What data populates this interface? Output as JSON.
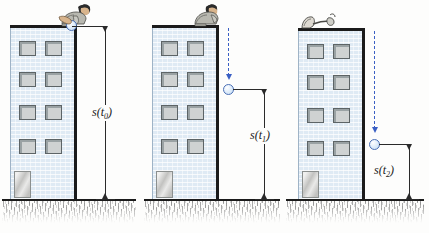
{
  "figure": {
    "background_color": "#fdfdfc",
    "building_color": "#dfeaf4",
    "ball_color": "#c3dcf2",
    "trajectory_color": "#3a5fc4",
    "outline_color": "#1b1b1b",
    "window_color": "#cfd2d2"
  },
  "panels": [
    {
      "id": "panel-1",
      "label": "s(t",
      "label_sub": "0",
      "label_close": ")",
      "label_full": "s(t0)",
      "person_pose": "leaning-over-roof-holding-ball",
      "ball_state": "held-at-roof-level",
      "trajectory_visible": false,
      "ball_height_description": "full building height",
      "windows_per_row": 2,
      "window_rows": 4
    },
    {
      "id": "panel-2",
      "label": "s(t",
      "label_sub": "1",
      "label_close": ")",
      "label_full": "s(t1)",
      "person_pose": "kneeling-watching-from-roof",
      "ball_state": "falling",
      "trajectory_visible": true,
      "ball_height_description": "partway down",
      "windows_per_row": 2,
      "window_rows": 4
    },
    {
      "id": "panel-3",
      "label": "s(t",
      "label_sub": "2",
      "label_close": ")",
      "label_full": "s(t2)",
      "person_pose": "standing-back-arm-visible",
      "ball_state": "falling-near-ground",
      "trajectory_visible": true,
      "ball_height_description": "near the ground",
      "windows_per_row": 2,
      "window_rows": 4
    }
  ]
}
